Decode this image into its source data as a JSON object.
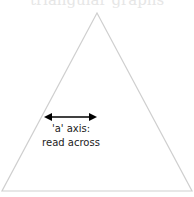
{
  "title": "triangular graphs",
  "diagram": {
    "shape": "equilateral-triangle",
    "outline_color": "#c8c8c8",
    "arrow_color": "#000000",
    "axis_label_line1": "'a' axis:",
    "axis_label_line2": "read across"
  }
}
